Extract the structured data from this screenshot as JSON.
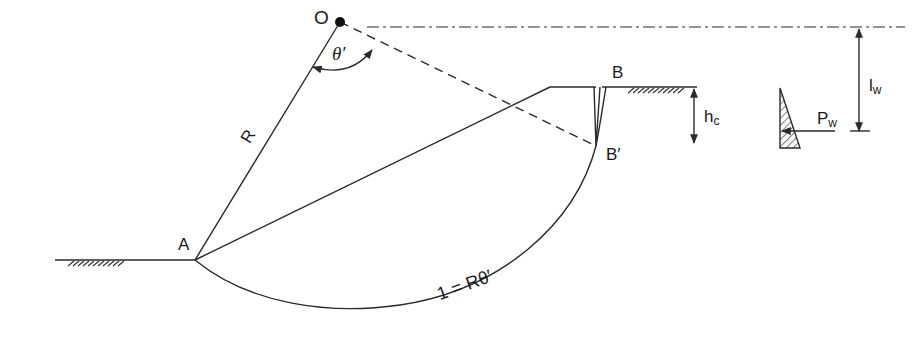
{
  "diagram": {
    "colors": {
      "line": "#2a2a2a",
      "background": "#ffffff",
      "hatch": "#333333"
    },
    "labels": {
      "center": "O",
      "angle": "θ′",
      "radius": "R",
      "toe": "A",
      "crest_point": "B",
      "crack_bottom": "B′",
      "crack_depth_main": "h",
      "crack_depth_sub": "c",
      "water_lever_main": "l",
      "water_lever_sub": "w",
      "water_force_main": "P",
      "water_force_sub": "w",
      "arc_length": "1 = Rθ′"
    },
    "geometry": {
      "O": [
        340,
        22
      ],
      "A": [
        195,
        260
      ],
      "B": [
        600,
        87
      ],
      "B_prime": [
        596,
        146
      ],
      "crest_start": [
        550,
        87
      ],
      "arc_bottom": [
        345,
        309
      ]
    }
  }
}
